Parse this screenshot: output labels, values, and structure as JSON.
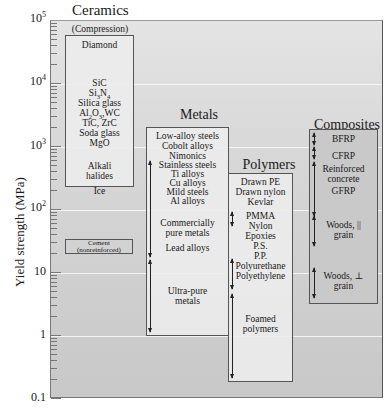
{
  "chart_data": {
    "type": "range-bar (log scale)",
    "title": "",
    "ylabel": "Yield strength (MPa)",
    "yscale": "log",
    "ylim": [
      0.1,
      100000
    ],
    "yticks": [
      "0.1",
      "1",
      "10",
      "10^2",
      "10^3",
      "10^4",
      "10^5"
    ],
    "grid": true,
    "categories": [
      "Ceramics",
      "Metals",
      "Polymers",
      "Composites"
    ],
    "groups": [
      {
        "name": "Ceramics",
        "subtitle": "(Compression)",
        "range": [
          80,
          60000
        ],
        "materials": [
          "Diamond",
          "SiC",
          "Si3N4",
          "Silica glass",
          "Al2O3, WC",
          "TiC, ZrC",
          "Soda glass",
          "MgO",
          "Alkali halides",
          "Ice"
        ],
        "extra": {
          "name": "Cement (nonreinforced)",
          "range": [
            20,
            35
          ]
        }
      },
      {
        "name": "Metals",
        "range": [
          1,
          1500
        ],
        "materials": [
          "Low-alloy steels",
          "Cobolt alloys",
          "Nimonics",
          "Stainless steels",
          "Ti alloys",
          "Cu alloys",
          "Mild steels",
          "Al alloys",
          "Commercially pure metals",
          "Lead alloys",
          "Ultra-pure metals"
        ],
        "arrow_ranges": [
          [
            20,
            600
          ],
          [
            1,
            15
          ]
        ]
      },
      {
        "name": "Polymers",
        "range": [
          0.15,
          250
        ],
        "materials": [
          "Drawn PE",
          "Drawn nylon",
          "Kevlar",
          "PMMA",
          "Nylon",
          "Epoxies",
          "P.S.",
          "P.P.",
          "Polyurethane",
          "Polyethylene",
          "Foamed polymers"
        ],
        "arrow_ranges": [
          [
            60,
            100
          ],
          [
            5,
            25
          ],
          [
            0.15,
            4
          ]
        ]
      },
      {
        "name": "Composites",
        "range": [
          1.8,
          1400
        ],
        "materials": [
          "BFRP",
          "CFRP",
          "Reinforced concrete",
          "GFRP",
          "Woods, || grain",
          "Woods, ⊥ grain"
        ],
        "arrow_ranges": [
          [
            700,
            1300
          ],
          [
            300,
            700
          ],
          [
            40,
            300
          ],
          [
            20,
            60
          ],
          [
            2,
            8
          ]
        ]
      }
    ]
  },
  "axis": {
    "title": "Yield strength (MPa)",
    "ticks": [
      {
        "base": "10",
        "exp": "5"
      },
      {
        "base": "10",
        "exp": "4"
      },
      {
        "base": "10",
        "exp": "3"
      },
      {
        "base": "10",
        "exp": "2"
      },
      {
        "base": "10",
        "exp": ""
      },
      {
        "base": "1",
        "exp": ""
      },
      {
        "base": "0.1",
        "exp": ""
      }
    ]
  },
  "ceramics": {
    "title": "Ceramics",
    "subtitle": "(Compression)",
    "items": [
      "Diamond",
      "SiC",
      "Si",
      "3",
      "N",
      "4",
      "Silica glass",
      "Al",
      "2",
      "O",
      "3",
      ",WC",
      "TiC, ZrC",
      "Soda glass",
      "MgO",
      "Alkali",
      "halides",
      "Ice"
    ],
    "cement_line1": "Cement",
    "cement_line2": "(nonreinforced)"
  },
  "metals": {
    "title": "Metals",
    "items": [
      "Low-alloy steels",
      "Cobolt alloys",
      "Nimonics",
      "Stainless steels",
      "Ti alloys",
      "Cu alloys",
      "Mild steels",
      "Al alloys",
      "Commercially",
      "pure metals",
      "Lead alloys",
      "Ultra-pure",
      "metals"
    ]
  },
  "polymers": {
    "title": "Polymers",
    "items": [
      "Drawn PE",
      "Drawn nylon",
      "Kevlar",
      "PMMA",
      "Nylon",
      "Epoxies",
      "P.S.",
      "P.P.",
      "Polyurethane",
      "Polyethylene",
      "Foamed",
      "polymers"
    ]
  },
  "composites": {
    "title": "Composites",
    "items": [
      "BFRP",
      "CFRP",
      "Reinforced",
      "concrete",
      "GFRP",
      "Woods, ||",
      "grain",
      "Woods, ⊥",
      "grain"
    ]
  }
}
